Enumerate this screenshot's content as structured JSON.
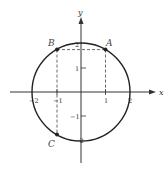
{
  "diagram": {
    "type": "unit-circle-radius-2",
    "axes": {
      "x_label": "x",
      "y_label": "y",
      "x_ticks": [
        {
          "value": -2,
          "label": "−2"
        },
        {
          "value": -1,
          "label": "−1"
        },
        {
          "value": 1,
          "label": "1"
        },
        {
          "value": 2,
          "label": "2"
        }
      ],
      "y_ticks": [
        {
          "value": 2,
          "label": "2"
        },
        {
          "value": 1,
          "label": "1"
        },
        {
          "value": -1,
          "label": "−1"
        },
        {
          "value": -2,
          "label": "−2"
        }
      ]
    },
    "circle": {
      "center": [
        0,
        0
      ],
      "radius": 2
    },
    "points": [
      {
        "label": "A",
        "x": 1,
        "y": 1.732
      },
      {
        "label": "B",
        "x": -1,
        "y": 1.732
      },
      {
        "label": "C",
        "x": -1,
        "y": -1.732
      }
    ],
    "colors": {
      "line": "#222222",
      "dashed": "#444444",
      "text": "#333333"
    }
  }
}
